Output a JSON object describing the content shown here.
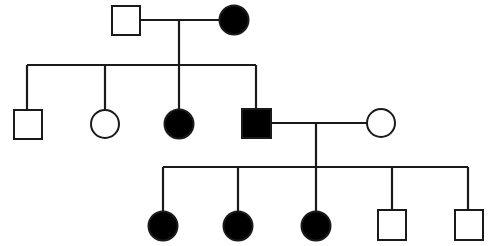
{
  "diagram": {
    "type": "pedigree",
    "colors": {
      "affected": "#000000",
      "unaffected": "#ffffff",
      "line": "#1a1a1a"
    },
    "generations": [
      {
        "label": "I",
        "members": [
          {
            "id": "I-1",
            "sex": "male",
            "affected": false
          },
          {
            "id": "I-2",
            "sex": "female",
            "affected": true
          }
        ]
      },
      {
        "label": "II",
        "members": [
          {
            "id": "II-1",
            "sex": "male",
            "affected": false
          },
          {
            "id": "II-2",
            "sex": "female",
            "affected": false
          },
          {
            "id": "II-3",
            "sex": "female",
            "affected": true
          },
          {
            "id": "II-4",
            "sex": "male",
            "affected": true
          },
          {
            "id": "II-5",
            "sex": "female",
            "affected": false,
            "spouse_of": "II-4"
          }
        ]
      },
      {
        "label": "III",
        "members": [
          {
            "id": "III-1",
            "sex": "female",
            "affected": true
          },
          {
            "id": "III-2",
            "sex": "female",
            "affected": true
          },
          {
            "id": "III-3",
            "sex": "female",
            "affected": true
          },
          {
            "id": "III-4",
            "sex": "male",
            "affected": false
          },
          {
            "id": "III-5",
            "sex": "male",
            "affected": false
          }
        ]
      }
    ]
  }
}
